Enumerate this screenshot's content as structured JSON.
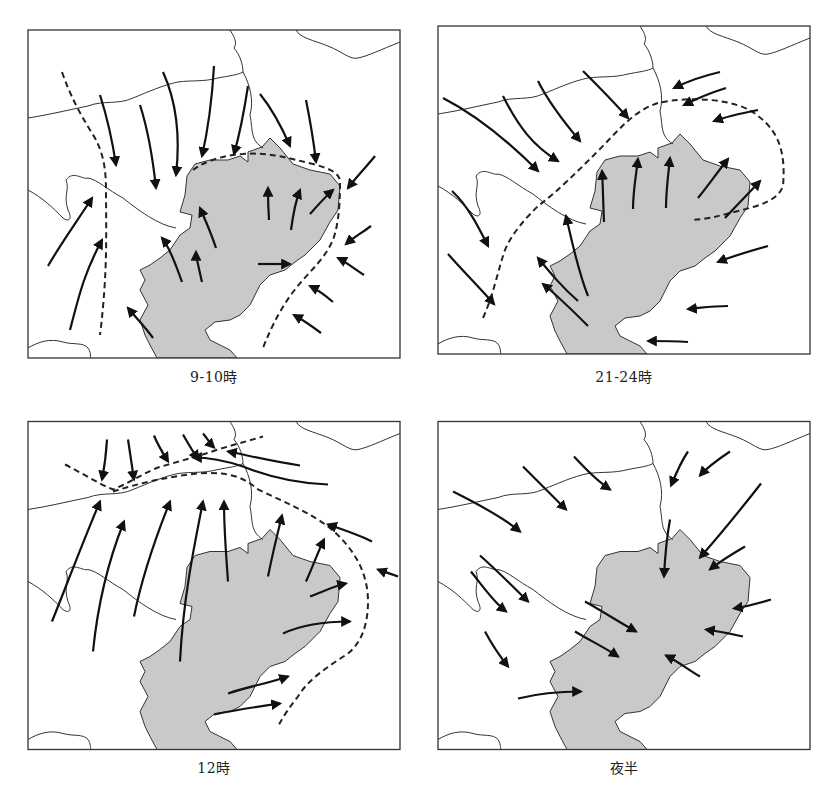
{
  "figure": {
    "type": "wind-field-maps",
    "colors": {
      "region_fill": "#c9c9c9",
      "line": "#333333",
      "arrow": "#111111",
      "background": "#ffffff"
    },
    "geography": {
      "region_outline": "M159,146 L167,134 L182,130 L200,130 L212,126 L220,132 L220,122 L234,117 L242,108 L252,118 L265,134 L282,140 L302,144 L312,156 L310,180 L302,192 L292,210 L277,225 L267,232 L257,240 L242,245 L232,255 L222,275 L212,285 L202,290 L187,292 L177,300 L182,310 L202,320 L209,328 L129,328 L122,315 L117,305 L112,290 L120,275 L112,260 L117,250 L112,240 L122,235 L132,228 L142,220 L152,205 L162,198 L164,185 L152,182 L157,165 Z",
      "rivers": [
        "M0,88 C20,85 40,80 60,76 C75,70 90,75 105,68 C120,62 135,55 150,52 C165,50 175,52 190,48 C200,46 210,45 215,42",
        "M215,42 C215,35 212,25 206,18 C210,12 205,5 202,0",
        "M215,42 C222,55 226,70 222,85 C225,100 222,110 235,118",
        "M268,0 C272,8 285,10 300,16 C315,22 322,30 330,28 C340,26 352,20 372,12",
        "M0,160 C15,168 25,178 35,188 C40,192 45,190 40,180 C35,165 42,160 38,150 C45,140 55,150 60,148 C70,150 80,160 95,168 C110,180 130,195 148,198",
        "M0,318 C10,312 22,308 35,312 C45,315 55,312 60,318 C63,322 62,326 63,328"
      ]
    },
    "panels": [
      {
        "id": "panel-9-10",
        "caption": "9-10時",
        "origin": [
          28,
          30
        ],
        "fronts": [
          "M34,42 C42,65 50,80 62,100 C72,115 78,130 78,160 C78,200 80,240 72,305",
          "M165,140 C175,132 195,125 215,124 C240,122 260,128 285,134 C300,138 310,142 312,150 C312,165 312,190 305,210 C295,232 280,242 265,262 C250,282 240,305 235,318"
        ],
        "winds": [
          "M72,65 C80,90 85,115 88,135",
          "M112,75 C120,100 125,130 128,158",
          "M135,42 C150,75 152,110 148,145",
          "M186,36 C184,70 180,100 174,126",
          "M220,56 C216,82 210,110 206,124",
          "M232,64 C245,80 255,100 262,116",
          "M278,70 C282,90 285,105 288,132",
          "M347,126 C340,135 330,145 320,158",
          "M343,196 C335,202 325,208 318,214",
          "M336,245 C328,240 318,232 310,228",
          "M305,272 C298,266 290,260 282,256",
          "M293,303 C285,297 275,290 266,285",
          "M20,236 C35,210 50,190 64,168",
          "M42,300 C50,270 55,245 74,210",
          "M125,308 C118,298 110,290 100,278",
          "M154,252 C148,235 140,215 134,208",
          "M174,252 C170,235 168,225 168,222",
          "M188,218 C182,200 175,185 172,178",
          "M241,190 C240,175 240,165 240,158",
          "M263,200 C265,185 268,170 272,160",
          "M282,184 C290,175 298,166 305,160",
          "M230,234 C240,234 250,234 262,234"
        ]
      },
      {
        "id": "panel-21-24",
        "caption": "21-24時",
        "origin": [
          438,
          26
        ],
        "fronts": [
          "M45,292 C55,270 60,245 65,230 C70,212 85,195 100,180 C120,165 140,145 160,125 C180,105 195,85 220,77 C250,70 300,72 320,90 C340,105 348,125 345,160 C340,175 320,180 300,185 C280,190 275,192 255,194"
        ],
        "winds": [
          "M5,72 C40,90 70,115 100,145",
          "M65,70 C80,100 95,120 120,135",
          "M100,55 C110,75 125,95 142,115",
          "M145,45 C160,60 175,75 190,92",
          "M282,46 C265,50 250,55 236,62",
          "M288,62 C272,67 260,72 246,79",
          "M320,84 C305,87 290,90 276,95",
          "M14,165 C30,180 40,200 50,220",
          "M10,228 C25,245 40,260 56,278",
          "M150,300 C135,285 120,270 105,258",
          "M140,275 C125,262 115,250 100,232",
          "M150,270 C140,245 135,220 128,190",
          "M166,196 C165,175 165,160 164,145",
          "M195,183 C195,165 198,150 200,133",
          "M228,182 C228,165 230,150 232,132",
          "M260,172 C270,160 278,148 290,133",
          "M287,192 C298,180 310,168 322,155",
          "M330,220 C312,225 295,230 280,236",
          "M290,280 C275,280 262,282 250,283",
          "M250,316 C235,315 225,315 210,315"
        ]
      },
      {
        "id": "panel-12",
        "caption": "12時",
        "origin": [
          28,
          420
        ],
        "fronts": [
          "M37,43 C55,52 70,62 85,68 C100,62 115,52 130,46 C150,40 170,35 190,28 C210,22 225,18 235,15",
          "M85,70 C110,62 140,55 170,52 C200,50 215,55 230,68 C255,80 280,90 300,105 C325,125 340,150 340,180 C340,200 335,220 320,232 C300,245 280,258 270,275 C262,285 255,295 250,305"
        ],
        "winds": [
          "M79,18 C78,35 76,48 74,58",
          "M100,18 C102,32 104,45 106,58",
          "M126,14 C130,24 135,32 140,40",
          "M155,13 C160,22 165,30 170,38",
          "M175,12 C180,18 183,23 186,26",
          "M272,44 C245,40 225,35 200,30",
          "M300,63 C270,62 240,55 215,45 C200,40 180,36 165,36",
          "M344,120 C330,113 315,108 300,103",
          "M370,155 C362,152 355,150 350,148",
          "M24,200 C40,160 55,120 72,80",
          "M65,230 C70,180 80,140 96,100",
          "M106,195 C115,150 130,110 142,80",
          "M152,240 C155,180 165,130 175,80",
          "M200,160 C198,130 196,110 196,80",
          "M240,155 C245,130 250,110 254,94",
          "M278,160 C285,145 290,130 296,118",
          "M282,175 C295,170 305,165 318,162",
          "M255,212 C270,205 290,200 322,200",
          "M200,272 C220,265 240,262 260,255",
          "M186,293 C210,288 230,285 252,282"
        ]
      },
      {
        "id": "panel-midnight",
        "caption": "夜半",
        "origin": [
          438,
          420
        ],
        "fronts": [],
        "winds": [
          "M15,70 C45,85 70,100 82,110",
          "M85,45 C100,60 115,75 128,88",
          "M136,35 C148,48 160,60 172,68",
          "M250,30 C243,40 238,52 233,64",
          "M292,30 C280,38 270,45 262,54",
          "M323,62 C305,85 285,110 262,136",
          "M232,98 C228,120 227,135 226,155",
          "M307,125 C295,132 282,140 272,148",
          "M333,178 C320,182 308,185 296,187",
          "M305,215 C292,212 282,210 268,208",
          "M262,255 C250,248 240,240 228,234",
          "M42,134 C60,150 75,165 90,180",
          "M33,150 C45,165 55,180 68,190",
          "M47,210 C55,225 62,235 70,245",
          "M147,180 C165,190 180,200 198,210",
          "M137,210 C150,218 165,225 180,235",
          "M80,277 C100,272 120,270 143,270"
        ]
      }
    ]
  }
}
